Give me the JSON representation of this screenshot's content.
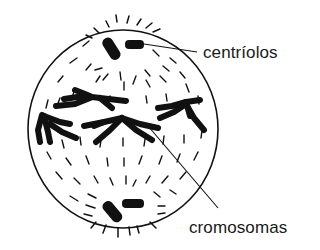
{
  "figure": {
    "colors": {
      "ink": "#111111",
      "label_text": "#1a1a1a",
      "background": "#ffffff"
    }
  },
  "labels": {
    "centriolos": "centríolos",
    "cromosomas": "cromosomas"
  },
  "structures": {
    "cell_membrane": {
      "cx": 123,
      "cy": 129,
      "rx": 95,
      "ry": 99
    },
    "centriole_pairs": [
      {
        "position": "top",
        "leader_to": "centriolos"
      },
      {
        "position": "bottom"
      }
    ],
    "chromosome_count": 5,
    "leader_lines": [
      {
        "from": "top-centriole",
        "to_label": "centriolos"
      },
      {
        "from": "equatorial-chromosome",
        "to_label": "cromosomas"
      }
    ]
  }
}
